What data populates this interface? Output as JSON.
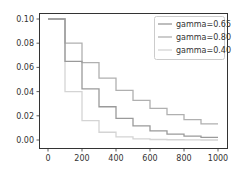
{
  "chart_data": {
    "type": "line",
    "subtype": "step",
    "title": "",
    "xlabel": "",
    "ylabel": "",
    "xlim": [
      -50,
      1050
    ],
    "ylim": [
      -0.005,
      0.105
    ],
    "grid": false,
    "legend_position": "upper right",
    "x_ticks": [
      0,
      200,
      400,
      600,
      800,
      1000
    ],
    "x_tick_labels": [
      "0",
      "200",
      "400",
      "600",
      "800",
      "1000"
    ],
    "y_ticks": [
      0.0,
      0.02,
      0.04,
      0.06,
      0.08,
      0.1
    ],
    "y_tick_labels": [
      "0.00",
      "0.02",
      "0.04",
      "0.06",
      "0.08",
      "0.10"
    ],
    "x": [
      0,
      100,
      200,
      300,
      400,
      500,
      600,
      700,
      800,
      900,
      1000
    ],
    "series": [
      {
        "name": "gamma=0.65",
        "color": "#9a9a9a",
        "values": [
          0.1,
          0.065,
          0.0423,
          0.0275,
          0.0179,
          0.0116,
          0.0075,
          0.0049,
          0.0032,
          0.0021,
          0.0021
        ]
      },
      {
        "name": "gamma=0.80",
        "color": "#b0b0b0",
        "values": [
          0.1,
          0.08,
          0.064,
          0.0512,
          0.041,
          0.0328,
          0.0262,
          0.021,
          0.0168,
          0.0134,
          0.0134
        ]
      },
      {
        "name": "gamma=0.40",
        "color": "#d4d4d4",
        "values": [
          0.1,
          0.04,
          0.016,
          0.0064,
          0.0026,
          0.001,
          0.0004,
          0.0002,
          0.0001,
          0.0,
          0.0
        ]
      }
    ]
  },
  "legend": {
    "items": [
      {
        "label": "gamma=0.65",
        "color": "#9a9a9a"
      },
      {
        "label": "gamma=0.80",
        "color": "#b0b0b0"
      },
      {
        "label": "gamma=0.40",
        "color": "#d4d4d4"
      }
    ]
  }
}
